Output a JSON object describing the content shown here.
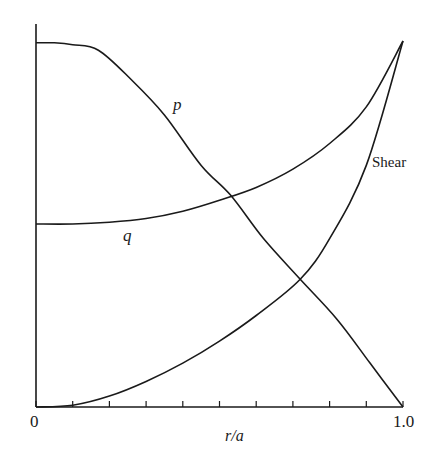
{
  "chart_data": {
    "type": "line",
    "title": "",
    "xlabel": "r/a",
    "ylabel": "",
    "xlim": [
      0,
      1.0
    ],
    "ylim": [
      0,
      1.0
    ],
    "grid": false,
    "legend": "inline curve labels",
    "x_tick_labels": [
      "0",
      "1.0"
    ],
    "x_ticks_count": 11,
    "series": [
      {
        "name": "p",
        "x": [
          0.0,
          0.05,
          0.1,
          0.17,
          0.26,
          0.35,
          0.45,
          0.53,
          0.62,
          0.72,
          0.82,
          0.91,
          1.0
        ],
        "values": [
          0.995,
          0.995,
          0.99,
          0.975,
          0.894,
          0.798,
          0.66,
          0.579,
          0.46,
          0.349,
          0.24,
          0.12,
          0.0
        ]
      },
      {
        "name": "q",
        "x": [
          0.0,
          0.1,
          0.2,
          0.3,
          0.4,
          0.5,
          0.6,
          0.7,
          0.8,
          0.9,
          1.0
        ],
        "values": [
          0.5,
          0.5,
          0.505,
          0.515,
          0.535,
          0.565,
          0.6,
          0.65,
          0.72,
          0.82,
          1.0
        ]
      },
      {
        "name": "Shear",
        "x": [
          0.0,
          0.1,
          0.2,
          0.3,
          0.4,
          0.5,
          0.6,
          0.72,
          0.8,
          0.9,
          1.0
        ],
        "values": [
          0.0,
          0.005,
          0.03,
          0.07,
          0.12,
          0.18,
          0.25,
          0.349,
          0.46,
          0.66,
          1.0
        ]
      }
    ],
    "annotations": [
      {
        "text": "p",
        "x": 0.47,
        "y": 0.79
      },
      {
        "text": "q",
        "x": 0.29,
        "y": 0.47
      },
      {
        "text": "Shear",
        "x": 0.92,
        "y": 0.67
      }
    ]
  },
  "labels": {
    "x_origin": "0",
    "x_end": "1.0",
    "x_axis": "r/a",
    "p": "p",
    "q": "q",
    "shear": "Shear"
  }
}
